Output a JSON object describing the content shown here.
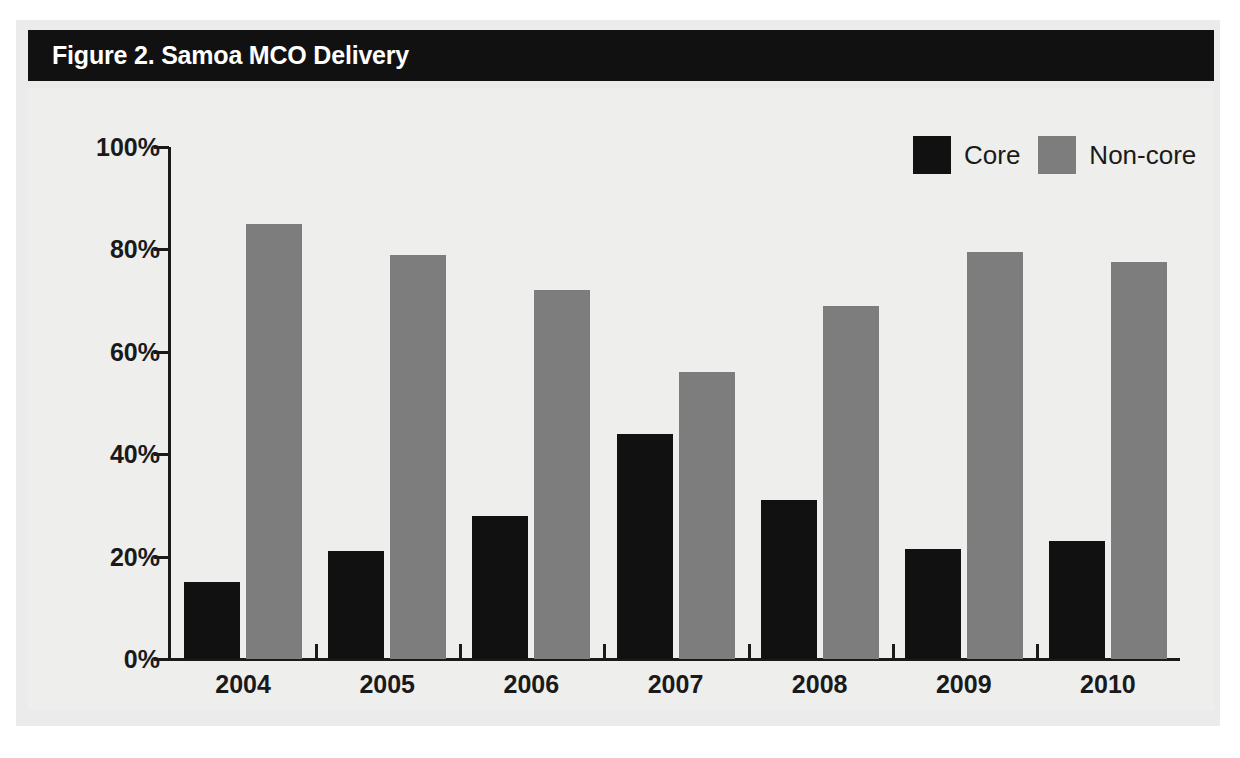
{
  "figure": {
    "title": "Figure 2. Samoa MCO Delivery",
    "title_bar_color": "#111111",
    "title_text_color": "#ffffff",
    "panel_color": "#ebebeb",
    "plot_background": "#eeeeec"
  },
  "legend": {
    "position": "top-right",
    "items": [
      {
        "label": "Core",
        "color": "#111111",
        "swatch": "legend-swatch-core"
      },
      {
        "label": "Non-core",
        "color": "#7d7d7d",
        "swatch": "legend-swatch-noncore"
      }
    ]
  },
  "axes": {
    "y_ticks": [
      "0%",
      "20%",
      "40%",
      "60%",
      "80%",
      "100%"
    ],
    "x_ticks": [
      "2004",
      "2005",
      "2006",
      "2007",
      "2008",
      "2009",
      "2010"
    ]
  },
  "chart_data": {
    "type": "bar",
    "title": "Figure 2. Samoa MCO Delivery",
    "subtitle": "",
    "xlabel": "",
    "ylabel": "",
    "categories": [
      "2004",
      "2005",
      "2006",
      "2007",
      "2008",
      "2009",
      "2010"
    ],
    "series": [
      {
        "name": "Core",
        "color": "#111111",
        "values": [
          15,
          21,
          28,
          44,
          31,
          21.5,
          23
        ]
      },
      {
        "name": "Non-core",
        "color": "#7d7d7d",
        "values": [
          85,
          79,
          72,
          56,
          69,
          79.5,
          77.5
        ]
      }
    ],
    "ylim": [
      0,
      100
    ],
    "ytick_values": [
      0,
      20,
      40,
      60,
      80,
      100
    ],
    "ytick_labels": [
      "0%",
      "20%",
      "40%",
      "60%",
      "80%",
      "100%"
    ],
    "grid": false,
    "legend_position": "top-right",
    "units": "percent"
  }
}
